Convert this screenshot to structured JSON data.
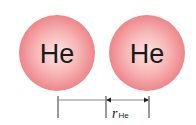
{
  "atoms": [
    {
      "symbol": "He",
      "cx": 57,
      "cy": 53,
      "r": 38
    },
    {
      "symbol": "He",
      "cx": 147,
      "cy": 53,
      "r": 38
    }
  ],
  "radius_label": {
    "main": "r",
    "sub": "He"
  },
  "colors": {
    "atom_edge": "#ef8a8e",
    "atom_center": "#fde4e3",
    "line": "#333333",
    "text": "#1a1a1a"
  }
}
